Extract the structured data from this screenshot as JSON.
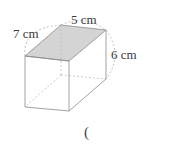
{
  "diagram": {
    "type": "rectangular-prism",
    "shaded_face": "top",
    "colors": {
      "edge": "#8a8a8a",
      "hidden_edge": "#b0b0b0",
      "shaded_face": "#d4d4d4",
      "dimension_arc": "#a0a0a0",
      "text": "#3a3a3a"
    },
    "labels": {
      "depth": "7 cm",
      "width": "5 cm",
      "height": "6 cm"
    }
  },
  "answer": {
    "open_paren": "("
  }
}
